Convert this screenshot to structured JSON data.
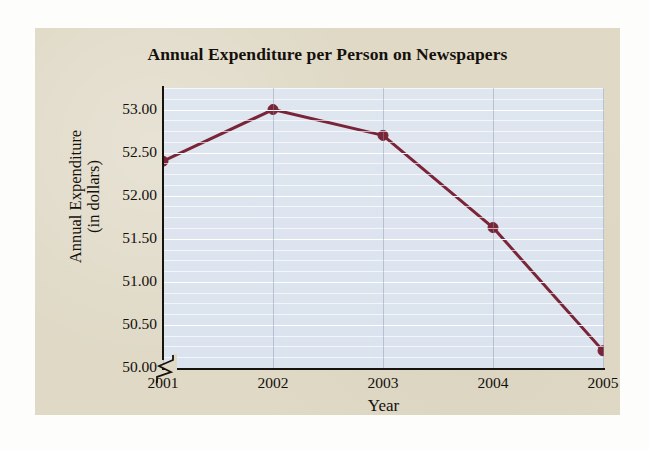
{
  "chart_data": {
    "type": "line",
    "title": "Annual Expenditure per Person on Newspapers",
    "xlabel": "Year",
    "ylabel": "Annual Expenditure\n(in dollars)",
    "ylabel_line1": "Annual Expenditure",
    "ylabel_line2": "(in dollars)",
    "categories": [
      "2001",
      "2002",
      "2003",
      "2004",
      "2005"
    ],
    "x": [
      2001,
      2002,
      2003,
      2004,
      2005
    ],
    "values": [
      52.4,
      53.0,
      52.7,
      51.63,
      50.2
    ],
    "series": [
      {
        "name": "Annual Expenditure per Person on Newspapers",
        "values": [
          52.4,
          53.0,
          52.7,
          51.63,
          50.2
        ]
      }
    ],
    "ylim": [
      50.0,
      53.25
    ],
    "y_ticks": [
      "53.00",
      "52.50",
      "52.00",
      "51.50",
      "51.00",
      "50.50",
      "50.00"
    ],
    "y_tick_values": [
      53.0,
      52.5,
      52.0,
      51.5,
      51.0,
      50.5,
      50.0
    ],
    "y_axis_has_break": true,
    "grid": "horizontal-and-vertical",
    "legend": "none",
    "line_color": "#7a2438",
    "marker_color": "#7a2438",
    "marker_shape": "circle",
    "plot_background": "#dbe3ee",
    "figure_background": "#dfd9c6",
    "gridline_color": "#ffffff",
    "axis_color": "#16120e",
    "text_color": "#15100c"
  }
}
